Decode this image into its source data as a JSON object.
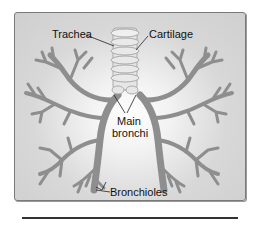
{
  "diagram": {
    "labels": {
      "trachea": "Trachea",
      "cartilage": "Cartilage",
      "main_bronchi_line1": "Main",
      "main_bronchi_line2": "bronchi",
      "bronchioles": "Bronchioles"
    },
    "colors": {
      "panel_bg": "#d8d8d8",
      "branch": "#8e8e8e",
      "trachea": "#e6e6e6",
      "border": "#7a7a7a",
      "text": "#111111"
    }
  }
}
